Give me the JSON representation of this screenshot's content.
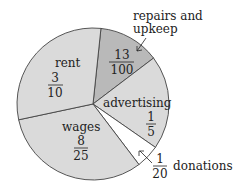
{
  "chart_data": {
    "type": "pie",
    "title": "",
    "center": [
      93,
      104
    ],
    "radius": 76,
    "start_angle_deg": -84,
    "slices": [
      {
        "name": "repairs and upkeep",
        "numerator": "13",
        "denominator": "100",
        "value": 0.13,
        "color": "#b9b9b9"
      },
      {
        "name": "advertising",
        "numerator": "1",
        "denominator": "5",
        "value": 0.2,
        "color": "#dadada"
      },
      {
        "name": "donations",
        "numerator": "1",
        "denominator": "20",
        "value": 0.05,
        "color": "#ffffff"
      },
      {
        "name": "wages",
        "numerator": "8",
        "denominator": "25",
        "value": 0.32,
        "color": "#dadada"
      },
      {
        "name": "rent",
        "numerator": "3",
        "denominator": "10",
        "value": 0.3,
        "color": "#dadada"
      }
    ]
  },
  "labels": {
    "repairs_line1": "repairs and",
    "repairs_line2": "upkeep",
    "repairs_num": "13",
    "repairs_den": "100",
    "advertising": "advertising",
    "advertising_num": "1",
    "advertising_den": "5",
    "donations": "donations",
    "donations_num": "1",
    "donations_den": "20",
    "wages": "wages",
    "wages_num": "8",
    "wages_den": "25",
    "rent": "rent",
    "rent_num": "3",
    "rent_den": "10"
  }
}
